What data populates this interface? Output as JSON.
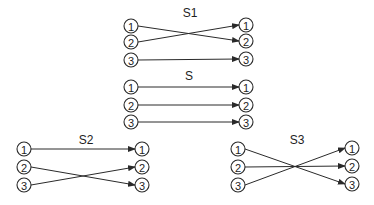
{
  "diagram": {
    "node_radius": 7,
    "colors": {
      "stroke": "#2a2a2a",
      "text": "#1e1e1e",
      "background": "#ffffff"
    },
    "permutations": [
      {
        "name": "S1",
        "label_pos": [
          190,
          17
        ],
        "left_x": 131,
        "right_x": 246,
        "left_y": [
          26,
          42,
          60
        ],
        "right_y": [
          25,
          41,
          59
        ],
        "mapping": [
          [
            1,
            2
          ],
          [
            2,
            1
          ],
          [
            3,
            3
          ]
        ],
        "left_labels": [
          "1",
          "2",
          "3"
        ],
        "right_labels": [
          "1",
          "2",
          "3"
        ]
      },
      {
        "name": "S",
        "label_pos": [
          189,
          80
        ],
        "left_x": 131,
        "right_x": 246,
        "left_y": [
          87,
          105,
          122
        ],
        "right_y": [
          87,
          105,
          122
        ],
        "mapping": [
          [
            1,
            1
          ],
          [
            2,
            2
          ],
          [
            3,
            3
          ]
        ],
        "left_labels": [
          "1",
          "2",
          "3"
        ],
        "right_labels": [
          "1",
          "2",
          "3"
        ]
      },
      {
        "name": "S2",
        "label_pos": [
          86,
          144
        ],
        "left_x": 24,
        "right_x": 142,
        "left_y": [
          149,
          167,
          185
        ],
        "right_y": [
          149,
          167,
          185
        ],
        "mapping": [
          [
            1,
            1
          ],
          [
            2,
            3
          ],
          [
            3,
            2
          ]
        ],
        "left_labels": [
          "1",
          "2",
          "3"
        ],
        "right_labels": [
          "1",
          "2",
          "3"
        ]
      },
      {
        "name": "S3",
        "label_pos": [
          297,
          144
        ],
        "left_x": 238,
        "right_x": 352,
        "left_y": [
          149,
          167,
          185
        ],
        "right_y": [
          148,
          166,
          184
        ],
        "mapping": [
          [
            1,
            3
          ],
          [
            2,
            2
          ],
          [
            3,
            1
          ]
        ],
        "left_labels": [
          "1",
          "2",
          "3"
        ],
        "right_labels": [
          "1",
          "2",
          "3"
        ]
      }
    ]
  }
}
